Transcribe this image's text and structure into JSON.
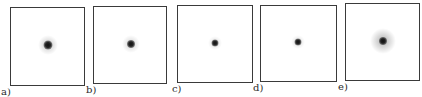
{
  "figure": {
    "panels": [
      {
        "label": "a)",
        "box": {
          "x": 10,
          "y": 7,
          "w": 75,
          "h": 79
        },
        "spot": {
          "cx": 48,
          "cy": 45,
          "core": 9,
          "halo": 20,
          "halo_opacity": 0.22
        },
        "label_pos": {
          "x": 1,
          "y": 87
        }
      },
      {
        "label": "b)",
        "box": {
          "x": 93,
          "y": 6,
          "w": 74,
          "h": 78
        },
        "spot": {
          "cx": 131,
          "cy": 44,
          "core": 8,
          "halo": 18,
          "halo_opacity": 0.18
        },
        "label_pos": {
          "x": 86,
          "y": 85
        }
      },
      {
        "label": "c)",
        "box": {
          "x": 177,
          "y": 5,
          "w": 76,
          "h": 78
        },
        "spot": {
          "cx": 215,
          "cy": 43,
          "core": 7,
          "halo": 14,
          "halo_opacity": 0.15
        },
        "label_pos": {
          "x": 172,
          "y": 84
        }
      },
      {
        "label": "d)",
        "box": {
          "x": 260,
          "y": 5,
          "w": 77,
          "h": 77
        },
        "spot": {
          "cx": 298,
          "cy": 42,
          "core": 7,
          "halo": 14,
          "halo_opacity": 0.15
        },
        "label_pos": {
          "x": 253,
          "y": 83
        }
      },
      {
        "label": "e)",
        "box": {
          "x": 345,
          "y": 3,
          "w": 75,
          "h": 78
        },
        "spot": {
          "cx": 383,
          "cy": 41,
          "core": 8,
          "halo": 26,
          "halo_opacity": 0.3
        },
        "label_pos": {
          "x": 338,
          "y": 82
        }
      }
    ],
    "colors": {
      "border": "#3a3a3a",
      "spot_core": "#111111",
      "label": "#2a2a2a",
      "background": "#ffffff"
    }
  }
}
